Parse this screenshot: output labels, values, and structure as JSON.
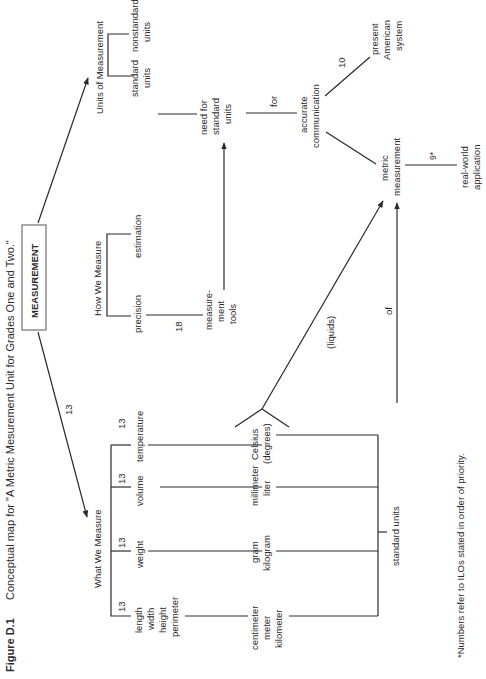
{
  "caption": {
    "label": "Figure D.1",
    "text": "Conceptual map for \"A Metric Mesurement Unit for Grades One and Two.\""
  },
  "root": {
    "label": "MEASUREMENT"
  },
  "branches": {
    "units": {
      "title": "Units of Measurement",
      "children": [
        "standard units",
        "nonstandard units"
      ],
      "standard": [
        "standard",
        "units"
      ],
      "nonstandard": [
        "nonstandard",
        "units"
      ]
    },
    "how": {
      "title": "How We Measure",
      "precision": "precision",
      "estimation": "estimation",
      "precision_link": "18",
      "tools": [
        "measure-",
        "ment",
        "tools"
      ]
    },
    "what": {
      "title": "What We Measure",
      "root_link": "13",
      "items": [
        {
          "label": [
            "length",
            "width",
            "height",
            "perimeter"
          ],
          "priority": "13",
          "units": [
            "centimeter",
            "meter",
            "kilometer"
          ]
        },
        {
          "label": [
            "weight"
          ],
          "priority": "13",
          "units": [
            "gram",
            "kilogram"
          ]
        },
        {
          "label": [
            "volume"
          ],
          "priority": "13",
          "units": [
            "millimeter",
            "liter"
          ]
        },
        {
          "label": [
            "temperature"
          ],
          "priority": "13",
          "units": [
            "Celsius",
            "(degrees)"
          ]
        }
      ],
      "standard_units": "standard units"
    }
  },
  "chain": {
    "need": [
      "need for",
      "standard",
      "units"
    ],
    "for": "for",
    "accurate": [
      "accurate",
      "communication"
    ],
    "present_link": "10",
    "present": [
      "present",
      "American",
      "system"
    ],
    "metric": [
      "metric",
      "measurement"
    ],
    "application_link": "9*",
    "application": [
      "real-world",
      "application"
    ],
    "liquids": "(liquids)",
    "of": "of"
  },
  "footnote": "*Numbers refer to ILOs stated in order of priority."
}
